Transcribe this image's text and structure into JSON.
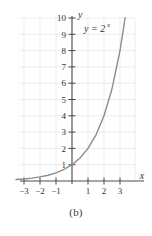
{
  "figure": {
    "caption": "(b)",
    "equation_label": "y = 2",
    "equation_exponent": "x",
    "xaxis_name": "x",
    "yaxis_name": "y"
  },
  "chart_data": {
    "type": "line",
    "title": "",
    "subtitle": "",
    "xlabel": "x",
    "ylabel": "y",
    "caption": "(b)",
    "function": "y = 2^x",
    "annotations": [
      "y = 2^x"
    ],
    "grid": true,
    "legend_position": "none",
    "xlim": [
      -3.5,
      3.6
    ],
    "ylim": [
      0,
      10.2
    ],
    "xticks": [
      -3,
      -2,
      -1,
      1,
      2,
      3
    ],
    "xtick_labels": [
      "−3",
      "−2",
      "−1",
      "1",
      "2",
      "3"
    ],
    "yticks": [
      1,
      2,
      3,
      4,
      5,
      6,
      7,
      8,
      9,
      10
    ],
    "ytick_labels": [
      "1",
      "2",
      "3",
      "4",
      "5",
      "6",
      "7",
      "8",
      "9",
      "10"
    ],
    "series": [
      {
        "name": "y = 2^x",
        "color": "#8c8c8c",
        "x": [
          -3.5,
          -3,
          -2.5,
          -2,
          -1.5,
          -1,
          -0.5,
          0,
          0.5,
          1,
          1.5,
          2,
          2.5,
          3,
          3.32
        ],
        "values": [
          0.088,
          0.125,
          0.177,
          0.25,
          0.354,
          0.5,
          0.707,
          1,
          1.414,
          2,
          2.828,
          4,
          5.657,
          8,
          10.0
        ]
      }
    ],
    "colors": {
      "curve": "#8c8c8c",
      "axis": "#4a4a4a",
      "grid": "#e2e2e2",
      "text": "#333333",
      "background": "#ffffff"
    }
  }
}
